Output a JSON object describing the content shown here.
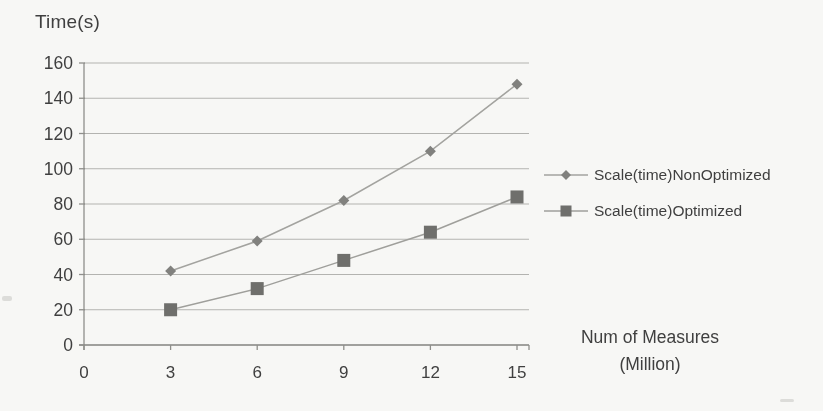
{
  "page": {
    "background": "#fbfbf9",
    "text_color": "#3d3d3d"
  },
  "chart_data": {
    "type": "line",
    "title": "",
    "ylabel": "Time(s)",
    "xlabel_line1": "Num of Measures",
    "xlabel_line2": "(Million)",
    "x": [
      3,
      6,
      9,
      12,
      15
    ],
    "xticks": [
      0,
      3,
      6,
      9,
      12,
      15
    ],
    "yticks": [
      0,
      20,
      40,
      60,
      80,
      100,
      120,
      140,
      160
    ],
    "xlim": [
      0,
      15
    ],
    "ylim": [
      0,
      160
    ],
    "grid": "horizontal",
    "legend_position": "right",
    "series": [
      {
        "name": "Scale(time)NonOptimized",
        "marker": "diamond",
        "values": [
          42,
          59,
          82,
          110,
          148
        ],
        "line_color": "#a4a4a0",
        "marker_color": "#81817e"
      },
      {
        "name": "Scale(time)Optimized",
        "marker": "square",
        "values": [
          20,
          32,
          48,
          64,
          84
        ],
        "line_color": "#a0a09c",
        "marker_color": "#6e6e6b"
      }
    ],
    "gridline_color": "#aeaeaa",
    "axis_color": "#8f8f8b",
    "tick_label_color": "#3d3d3d"
  }
}
